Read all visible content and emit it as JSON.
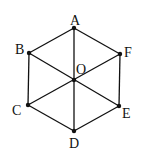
{
  "diagram": {
    "points": [
      {
        "id": "A",
        "label": "A"
      },
      {
        "id": "B",
        "label": "B"
      },
      {
        "id": "C",
        "label": "C"
      },
      {
        "id": "D",
        "label": "D"
      },
      {
        "id": "E",
        "label": "E"
      },
      {
        "id": "F",
        "label": "F"
      },
      {
        "id": "O",
        "label": "O"
      }
    ],
    "segments": [
      [
        "A",
        "B"
      ],
      [
        "B",
        "C"
      ],
      [
        "C",
        "D"
      ],
      [
        "D",
        "E"
      ],
      [
        "E",
        "F"
      ],
      [
        "F",
        "A"
      ],
      [
        "A",
        "D"
      ],
      [
        "B",
        "E"
      ],
      [
        "C",
        "F"
      ]
    ]
  }
}
